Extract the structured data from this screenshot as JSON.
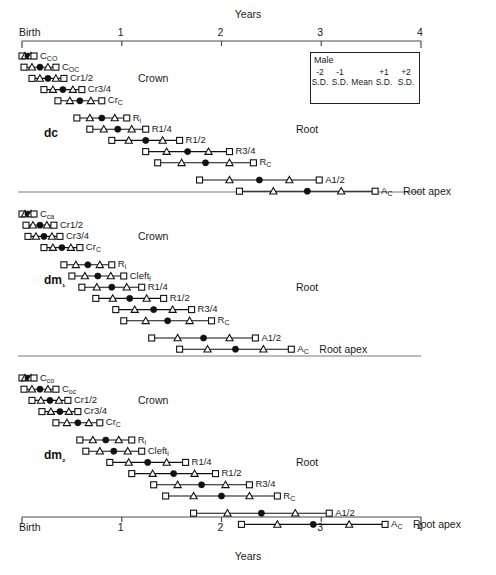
{
  "chart_data": {
    "type": "scatter",
    "title": "",
    "xlabel": "Years",
    "ylabel": "",
    "xlim": [
      0,
      4
    ],
    "xticks": [
      0,
      1,
      2,
      3,
      4
    ],
    "xtick_labels": [
      "Birth",
      "1",
      "2",
      "3",
      "4"
    ],
    "grid": false,
    "legend_position": "top-right",
    "marker_semantics": {
      "square": "S.D. (±2)",
      "triangle": "S.D. (±1)",
      "filled_circle": "Mean"
    },
    "panels": [
      {
        "name": "dc",
        "stage_groups": [
          "Crown",
          "Root",
          "Root apex"
        ],
        "rows": [
          {
            "label": "C",
            "sub": "CO",
            "stage": "Crown",
            "m2": 0.0,
            "m1": 0.03,
            "mean": 0.06,
            "p1": 0.09,
            "p2": 0.12
          },
          {
            "label": "C",
            "sub": "OC",
            "stage": "Crown",
            "m2": 0.02,
            "m1": 0.1,
            "mean": 0.18,
            "p1": 0.26,
            "p2": 0.34
          },
          {
            "label": "Cr1/2",
            "sub": "",
            "stage": "Crown",
            "m2": 0.1,
            "m1": 0.18,
            "mean": 0.26,
            "p1": 0.34,
            "p2": 0.42
          },
          {
            "label": "Cr3/4",
            "sub": "",
            "stage": "Crown",
            "m2": 0.22,
            "m1": 0.31,
            "mean": 0.41,
            "p1": 0.51,
            "p2": 0.6
          },
          {
            "label": "Cr",
            "sub": "C",
            "stage": "Crown",
            "m2": 0.36,
            "m1": 0.48,
            "mean": 0.58,
            "p1": 0.69,
            "p2": 0.8
          },
          {
            "label": "R",
            "sub": "i",
            "stage": "Root",
            "m2": 0.55,
            "m1": 0.68,
            "mean": 0.8,
            "p1": 0.93,
            "p2": 1.05
          },
          {
            "label": "R1/4",
            "sub": "",
            "stage": "Root",
            "m2": 0.68,
            "m1": 0.82,
            "mean": 0.96,
            "p1": 1.1,
            "p2": 1.24
          },
          {
            "label": "R1/2",
            "sub": "",
            "stage": "Root",
            "m2": 0.9,
            "m1": 1.07,
            "mean": 1.24,
            "p1": 1.41,
            "p2": 1.58
          },
          {
            "label": "R3/4",
            "sub": "",
            "stage": "Root",
            "m2": 1.24,
            "m1": 1.45,
            "mean": 1.66,
            "p1": 1.87,
            "p2": 2.08
          },
          {
            "label": "R",
            "sub": "C",
            "stage": "Root",
            "m2": 1.36,
            "m1": 1.6,
            "mean": 1.84,
            "p1": 2.08,
            "p2": 2.32
          },
          {
            "label": "A1/2",
            "sub": "",
            "stage": "Root apex",
            "m2": 1.78,
            "m1": 2.08,
            "mean": 2.38,
            "p1": 2.68,
            "p2": 2.98
          },
          {
            "label": "A",
            "sub": "C",
            "stage": "Root apex",
            "m2": 2.18,
            "m1": 2.52,
            "mean": 2.86,
            "p1": 3.2,
            "p2": 3.54
          }
        ]
      },
      {
        "name": "dm₁",
        "stage_groups": [
          "Crown",
          "Root",
          "Root apex"
        ],
        "rows": [
          {
            "label": "C",
            "sub": "ca",
            "stage": "Crown",
            "m2": 0.0,
            "m1": 0.03,
            "mean": 0.06,
            "p1": 0.09,
            "p2": 0.12
          },
          {
            "label": "Cr1/2",
            "sub": "",
            "stage": "Crown",
            "m2": 0.04,
            "m1": 0.11,
            "mean": 0.18,
            "p1": 0.25,
            "p2": 0.32
          },
          {
            "label": "Cr3/4",
            "sub": "",
            "stage": "Crown",
            "m2": 0.06,
            "m1": 0.14,
            "mean": 0.22,
            "p1": 0.3,
            "p2": 0.38
          },
          {
            "label": "Cr",
            "sub": "C",
            "stage": "Crown",
            "m2": 0.22,
            "m1": 0.31,
            "mean": 0.4,
            "p1": 0.49,
            "p2": 0.58
          },
          {
            "label": "R",
            "sub": "i",
            "stage": "Root",
            "m2": 0.42,
            "m1": 0.54,
            "mean": 0.66,
            "p1": 0.78,
            "p2": 0.9
          },
          {
            "label": "Cleft",
            "sub": "i",
            "stage": "Root",
            "m2": 0.5,
            "m1": 0.63,
            "mean": 0.76,
            "p1": 0.89,
            "p2": 1.02
          },
          {
            "label": "R1/4",
            "sub": "",
            "stage": "Root",
            "m2": 0.6,
            "m1": 0.75,
            "mean": 0.9,
            "p1": 1.05,
            "p2": 1.2
          },
          {
            "label": "R1/2",
            "sub": "",
            "stage": "Root",
            "m2": 0.74,
            "m1": 0.91,
            "mean": 1.08,
            "p1": 1.25,
            "p2": 1.42
          },
          {
            "label": "R3/4",
            "sub": "",
            "stage": "Root",
            "m2": 0.94,
            "m1": 1.13,
            "mean": 1.32,
            "p1": 1.51,
            "p2": 1.7
          },
          {
            "label": "R",
            "sub": "C",
            "stage": "Root",
            "m2": 1.02,
            "m1": 1.24,
            "mean": 1.46,
            "p1": 1.68,
            "p2": 1.9
          },
          {
            "label": "A1/2",
            "sub": "",
            "stage": "Root apex",
            "m2": 1.3,
            "m1": 1.56,
            "mean": 1.82,
            "p1": 2.08,
            "p2": 2.34
          },
          {
            "label": "A",
            "sub": "C",
            "stage": "Root apex",
            "m2": 1.58,
            "m1": 1.86,
            "mean": 2.14,
            "p1": 2.42,
            "p2": 2.7
          }
        ]
      },
      {
        "name": "dm₂",
        "stage_groups": [
          "Crown",
          "Root",
          "Root apex"
        ],
        "rows": [
          {
            "label": "C",
            "sub": "co",
            "stage": "Crown",
            "m2": 0.0,
            "m1": 0.03,
            "mean": 0.06,
            "p1": 0.09,
            "p2": 0.12
          },
          {
            "label": "C",
            "sub": "oc",
            "stage": "Crown",
            "m2": 0.02,
            "m1": 0.1,
            "mean": 0.18,
            "p1": 0.26,
            "p2": 0.34
          },
          {
            "label": "Cr1/2",
            "sub": "",
            "stage": "Crown",
            "m2": 0.1,
            "m1": 0.19,
            "mean": 0.28,
            "p1": 0.37,
            "p2": 0.46
          },
          {
            "label": "Cr3/4",
            "sub": "",
            "stage": "Crown",
            "m2": 0.2,
            "m1": 0.29,
            "mean": 0.38,
            "p1": 0.47,
            "p2": 0.56
          },
          {
            "label": "Cr",
            "sub": "C",
            "stage": "Crown",
            "m2": 0.34,
            "m1": 0.45,
            "mean": 0.56,
            "p1": 0.67,
            "p2": 0.78
          },
          {
            "label": "R",
            "sub": "i",
            "stage": "Root",
            "m2": 0.58,
            "m1": 0.71,
            "mean": 0.84,
            "p1": 0.97,
            "p2": 1.1
          },
          {
            "label": "Cleft",
            "sub": "i",
            "stage": "Root",
            "m2": 0.64,
            "m1": 0.78,
            "mean": 0.92,
            "p1": 1.06,
            "p2": 1.2
          },
          {
            "label": "R1/4",
            "sub": "",
            "stage": "Root",
            "m2": 0.88,
            "m1": 1.07,
            "mean": 1.26,
            "p1": 1.45,
            "p2": 1.64
          },
          {
            "label": "R1/2",
            "sub": "",
            "stage": "Root",
            "m2": 1.1,
            "m1": 1.31,
            "mean": 1.52,
            "p1": 1.73,
            "p2": 1.94
          },
          {
            "label": "R3/4",
            "sub": "",
            "stage": "Root",
            "m2": 1.32,
            "m1": 1.56,
            "mean": 1.8,
            "p1": 2.04,
            "p2": 2.28
          },
          {
            "label": "R",
            "sub": "C",
            "stage": "Root",
            "m2": 1.44,
            "m1": 1.72,
            "mean": 2.0,
            "p1": 2.28,
            "p2": 2.56
          },
          {
            "label": "A1/2",
            "sub": "",
            "stage": "Root apex",
            "m2": 1.72,
            "m1": 2.06,
            "mean": 2.4,
            "p1": 2.74,
            "p2": 3.08
          },
          {
            "label": "A",
            "sub": "C",
            "stage": "Root apex",
            "m2": 2.2,
            "m1": 2.56,
            "mean": 2.92,
            "p1": 3.28,
            "p2": 3.64
          }
        ]
      }
    ]
  },
  "axis": {
    "top_title": "Years",
    "bottom_title": "Years",
    "ticks": [
      "Birth",
      "1",
      "2",
      "3",
      "4"
    ]
  },
  "legend": {
    "title": "Male",
    "numbers": [
      "-2",
      "-1",
      "",
      "+1",
      "+2"
    ],
    "sd_labels": [
      "S.D.",
      "S.D.",
      "Mean",
      "S.D.",
      "S.D."
    ]
  },
  "panel_names": {
    "p1": "dc",
    "p2": "dm₁",
    "p3": "dm₂"
  },
  "stage_labels": {
    "crown": "Crown",
    "root": "Root",
    "root_apex": "Root apex"
  }
}
